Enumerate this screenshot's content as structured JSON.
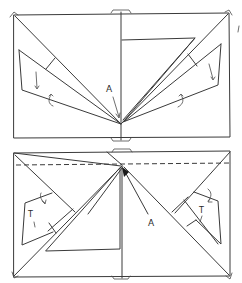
{
  "figure": {
    "type": "hand-drawn folding diagram",
    "stroke_color": "#3a3a3a",
    "background": "#ffffff",
    "panels": [
      {
        "id": "top",
        "labels": {
          "point_label": "A",
          "left_flap_mark": "I",
          "right_flap_mark": "I",
          "corner_mark": "I"
        },
        "elements": [
          "outer rectangle",
          "center vertical fold",
          "diagonal creases from top corners to point A",
          "left triangular flap",
          "right triangular flap",
          "upper-right horizontal flap",
          "curved fold arrows"
        ]
      },
      {
        "id": "bottom",
        "labels": {
          "point_label": "A",
          "left_flap_mark": "T",
          "right_flap_mark": "T"
        },
        "elements": [
          "outer rectangle",
          "dashed horizontal fold line",
          "center vertical fold",
          "diagonal creases from bottom corners to top center",
          "left flap",
          "right flap",
          "lower-left horizontal flap",
          "curved fold arrows",
          "filled apex marker"
        ]
      }
    ]
  }
}
